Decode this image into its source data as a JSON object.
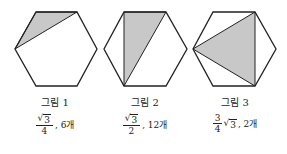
{
  "figures": [
    {
      "label": "그림 1",
      "value": {
        "num_sqrt": "3",
        "num_coef": "",
        "den": "4",
        "suffix": ", 6개"
      },
      "hexagon": "36,12 77,12 97,49 77,86 36,86 15,49",
      "shaded": "36,12 77,12 15,49"
    },
    {
      "label": "그림 2",
      "value": {
        "num_sqrt": "3",
        "num_coef": "",
        "den": "2",
        "suffix": ", 12개"
      },
      "hexagon": "124,12 166,12 187,49 166,86 124,86 104,49",
      "shaded": "124,12 166,12 124,86"
    },
    {
      "label": "그림 3",
      "value": {
        "frac_num": "3",
        "den": "4",
        "sqrt": "3",
        "suffix": ", 2개"
      },
      "hexagon": "213,12 255,12 276,49 255,86 213,86 193,49",
      "shaded": "193,49 255,12 255,86"
    }
  ],
  "colors": {
    "stroke": "#222222",
    "shade": "#c8c8c8"
  }
}
